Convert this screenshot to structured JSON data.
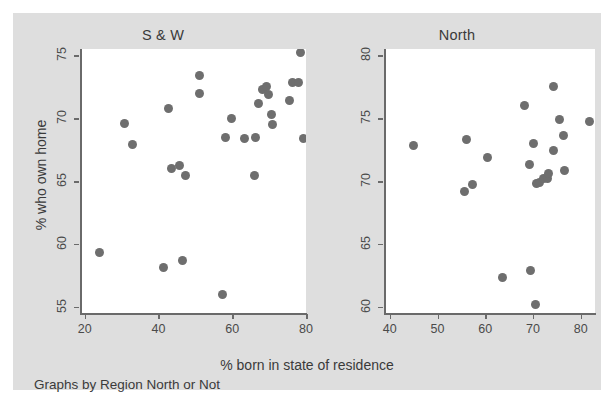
{
  "figure": {
    "y_axis_title": "% who own home",
    "x_axis_title": "% born in state of residence",
    "footnote": "Graphs by Region North or Not",
    "marker_color": "#6e6e6e",
    "panel_background": "#ffffff",
    "canvas_background": "#dedede",
    "axis_color": "#6a6a6a"
  },
  "chart_data": [
    {
      "type": "scatter",
      "title": "S & W",
      "xlabel": "% born in state of residence",
      "ylabel": "% who own home",
      "xlim": [
        19,
        80
      ],
      "ylim": [
        54.5,
        75.5
      ],
      "xticks": [
        20,
        40,
        60,
        80
      ],
      "yticks": [
        55,
        60,
        65,
        70,
        75
      ],
      "grid": false,
      "legend": "none",
      "points": [
        {
          "x": 24.0,
          "y": 59.3
        },
        {
          "x": 30.8,
          "y": 69.6
        },
        {
          "x": 33.0,
          "y": 67.9
        },
        {
          "x": 41.5,
          "y": 58.1
        },
        {
          "x": 42.7,
          "y": 70.8
        },
        {
          "x": 43.4,
          "y": 66.0
        },
        {
          "x": 45.6,
          "y": 66.2
        },
        {
          "x": 46.5,
          "y": 58.7
        },
        {
          "x": 47.3,
          "y": 65.4
        },
        {
          "x": 51.0,
          "y": 73.4
        },
        {
          "x": 51.1,
          "y": 72.0
        },
        {
          "x": 57.4,
          "y": 56.0
        },
        {
          "x": 58.2,
          "y": 68.5
        },
        {
          "x": 59.9,
          "y": 70.0
        },
        {
          "x": 63.3,
          "y": 68.4
        },
        {
          "x": 66.0,
          "y": 65.4
        },
        {
          "x": 66.4,
          "y": 68.5
        },
        {
          "x": 67.2,
          "y": 71.2
        },
        {
          "x": 68.3,
          "y": 72.3
        },
        {
          "x": 69.4,
          "y": 72.5
        },
        {
          "x": 69.9,
          "y": 71.9
        },
        {
          "x": 70.6,
          "y": 70.3
        },
        {
          "x": 71.0,
          "y": 69.5
        },
        {
          "x": 75.6,
          "y": 71.4
        },
        {
          "x": 76.4,
          "y": 72.8
        },
        {
          "x": 78.1,
          "y": 72.8
        },
        {
          "x": 78.6,
          "y": 75.2
        },
        {
          "x": 79.4,
          "y": 68.4
        }
      ]
    },
    {
      "type": "scatter",
      "title": "North",
      "xlabel": "% born in state of residence",
      "ylabel": "% who own home",
      "xlim": [
        39,
        83
      ],
      "ylim": [
        59.5,
        80.5
      ],
      "xticks": [
        40,
        50,
        60,
        70,
        80
      ],
      "yticks": [
        60,
        65,
        70,
        75,
        80
      ],
      "grid": false,
      "legend": "none",
      "points": [
        {
          "x": 45.0,
          "y": 72.8
        },
        {
          "x": 55.6,
          "y": 69.2
        },
        {
          "x": 56.0,
          "y": 73.3
        },
        {
          "x": 57.3,
          "y": 69.7
        },
        {
          "x": 60.5,
          "y": 71.9
        },
        {
          "x": 63.6,
          "y": 62.3
        },
        {
          "x": 68.2,
          "y": 76.0
        },
        {
          "x": 69.2,
          "y": 71.3
        },
        {
          "x": 69.4,
          "y": 62.9
        },
        {
          "x": 70.2,
          "y": 73.0
        },
        {
          "x": 70.6,
          "y": 60.2
        },
        {
          "x": 70.7,
          "y": 69.8
        },
        {
          "x": 71.3,
          "y": 69.9
        },
        {
          "x": 72.2,
          "y": 70.2
        },
        {
          "x": 73.0,
          "y": 70.2
        },
        {
          "x": 73.2,
          "y": 70.6
        },
        {
          "x": 74.2,
          "y": 77.5
        },
        {
          "x": 74.4,
          "y": 72.4
        },
        {
          "x": 75.5,
          "y": 74.9
        },
        {
          "x": 76.3,
          "y": 73.6
        },
        {
          "x": 76.7,
          "y": 70.8
        },
        {
          "x": 81.8,
          "y": 74.7
        }
      ]
    }
  ]
}
